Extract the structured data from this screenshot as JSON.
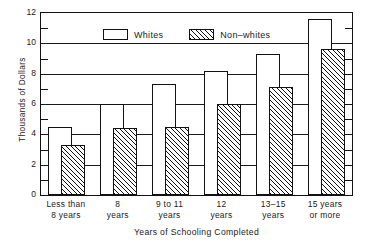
{
  "chart_data": {
    "type": "bar",
    "title": "",
    "xlabel": "Years of Schooling Completed",
    "ylabel": "Thousands of Dollars",
    "ylim": [
      0,
      12
    ],
    "ytick_labels": [
      "0",
      "2",
      "4",
      "6",
      "8",
      "10",
      "12"
    ],
    "ytick_values": [
      0,
      2,
      4,
      6,
      8,
      10,
      12
    ],
    "yminor_values": [
      1,
      3,
      5,
      7,
      9,
      11
    ],
    "grid": true,
    "legend_position": "top-left-inside",
    "categories": [
      "Less than 8 years",
      "8 years",
      "9 to 11 years",
      "12 years",
      "13–15 years",
      "15 years or more"
    ],
    "category_lines": [
      [
        "Less than",
        "8 years"
      ],
      [
        "8",
        "years"
      ],
      [
        "9 to 11",
        "years"
      ],
      [
        "12",
        "years"
      ],
      [
        "13–15",
        "years"
      ],
      [
        "15 years",
        "or more"
      ]
    ],
    "series": [
      {
        "name": "Whites",
        "fill": "solid-white",
        "values": [
          4.5,
          6.0,
          7.3,
          8.2,
          9.3,
          11.6
        ]
      },
      {
        "name": "Non–whites",
        "fill": "diagonal-hatch",
        "values": [
          3.3,
          4.45,
          4.5,
          6.0,
          7.1,
          9.6
        ]
      }
    ]
  },
  "colors": {
    "ink": "#111111",
    "plot_background": "#ffffff",
    "page_background": "#ffffff"
  }
}
